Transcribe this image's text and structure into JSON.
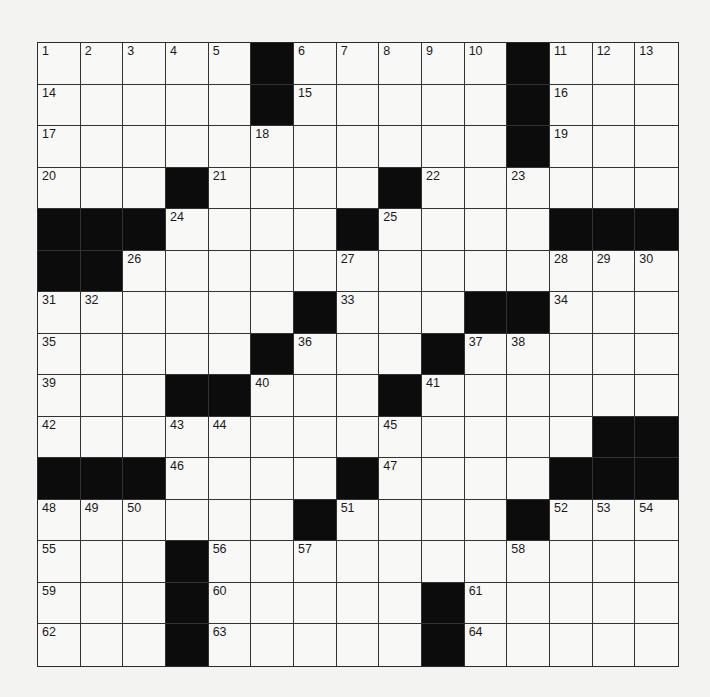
{
  "puzzle": {
    "rows": 15,
    "cols": 15,
    "grid": [
      [
        "1",
        "2",
        "3",
        "4",
        "5",
        "#",
        "6",
        "7",
        "8",
        "9",
        "10",
        "#",
        "11",
        "12",
        "13"
      ],
      [
        "14",
        "",
        "",
        "",
        "",
        "#",
        "15",
        "",
        "",
        "",
        "",
        "#",
        "16",
        "",
        ""
      ],
      [
        "17",
        "",
        "",
        "",
        "",
        "18",
        "",
        "",
        "",
        "",
        "",
        "#",
        "19",
        "",
        ""
      ],
      [
        "20",
        "",
        "",
        "#",
        "21",
        "",
        "",
        "",
        "#",
        "22",
        "",
        "23",
        "",
        "",
        ""
      ],
      [
        "#",
        "#",
        "#",
        "24",
        "",
        "",
        "",
        "#",
        "25",
        "",
        "",
        "",
        "#",
        "#",
        "#"
      ],
      [
        "#",
        "#",
        "26",
        "",
        "",
        "",
        "",
        "27",
        "",
        "",
        "",
        "",
        "28",
        "29",
        "30"
      ],
      [
        "31",
        "32",
        "",
        "",
        "",
        "",
        "#",
        "33",
        "",
        "",
        "#",
        "#",
        "34",
        "",
        ""
      ],
      [
        "35",
        "",
        "",
        "",
        "",
        "#",
        "36",
        "",
        "",
        "#",
        "37",
        "38",
        "",
        "",
        ""
      ],
      [
        "39",
        "",
        "",
        "#",
        "#",
        "40",
        "",
        "",
        "#",
        "41",
        "",
        "",
        "",
        "",
        ""
      ],
      [
        "42",
        "",
        "",
        "43",
        "44",
        "",
        "",
        "",
        "45",
        "",
        "",
        "",
        "",
        "#",
        "#"
      ],
      [
        "#",
        "#",
        "#",
        "46",
        "",
        "",
        "",
        "#",
        "47",
        "",
        "",
        "",
        "#",
        "#",
        "#"
      ],
      [
        "48",
        "49",
        "50",
        "",
        "",
        "",
        "#",
        "51",
        "",
        "",
        "",
        "#",
        "52",
        "53",
        "54"
      ],
      [
        "55",
        "",
        "",
        "#",
        "56",
        "",
        "57",
        "",
        "",
        "",
        "",
        "58",
        "",
        "",
        ""
      ],
      [
        "59",
        "",
        "",
        "#",
        "60",
        "",
        "",
        "",
        "",
        "#",
        "61",
        "",
        "",
        "",
        ""
      ],
      [
        "62",
        "",
        "",
        "#",
        "63",
        "",
        "",
        "",
        "",
        "#",
        "64",
        "",
        "",
        "",
        ""
      ]
    ],
    "entries": "all cells empty",
    "colors": {
      "black_square": "#0c0c0c",
      "grid_line": "#333333",
      "paper": "#f3f3f1"
    }
  }
}
